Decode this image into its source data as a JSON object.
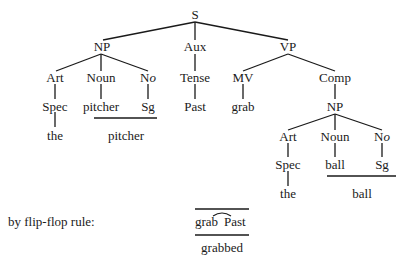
{
  "tree": {
    "root": "S",
    "np1": {
      "label": "NP",
      "art": "Art",
      "noun": "Noun",
      "no_prefix": "N",
      "no_suffix": "o",
      "spec": "Spec",
      "pitcher": "pitcher",
      "sg": "Sg",
      "the": "the",
      "combined": "pitcher"
    },
    "aux": {
      "label": "Aux",
      "tense": "Tense",
      "past": "Past"
    },
    "vp": {
      "label": "VP",
      "mv": "MV",
      "grab": "grab",
      "comp": "Comp",
      "np2": {
        "label": "NP",
        "art": "Art",
        "noun": "Noun",
        "no_prefix": "N",
        "no_suffix": "o",
        "spec": "Spec",
        "ball": "ball",
        "sg": "Sg",
        "the": "the",
        "combined": "ball"
      }
    }
  },
  "rule": {
    "caption": "by flip-flop rule:",
    "left": "grab",
    "right": "Past",
    "result": "grabbed"
  },
  "colors": {
    "ink": "#1a1a1a",
    "background": "#ffffff"
  }
}
